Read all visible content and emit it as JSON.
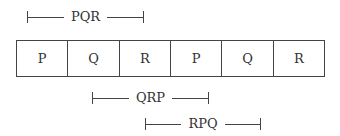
{
  "diagram": {
    "cells": [
      "P",
      "Q",
      "R",
      "P",
      "Q",
      "R"
    ],
    "brackets": [
      {
        "label": "PQR",
        "start_cell": 0,
        "end_cell": 2
      },
      {
        "label": "QRP",
        "start_cell": 1,
        "end_cell": 3
      },
      {
        "label": "RPQ",
        "start_cell": 2,
        "end_cell": 4
      }
    ]
  }
}
